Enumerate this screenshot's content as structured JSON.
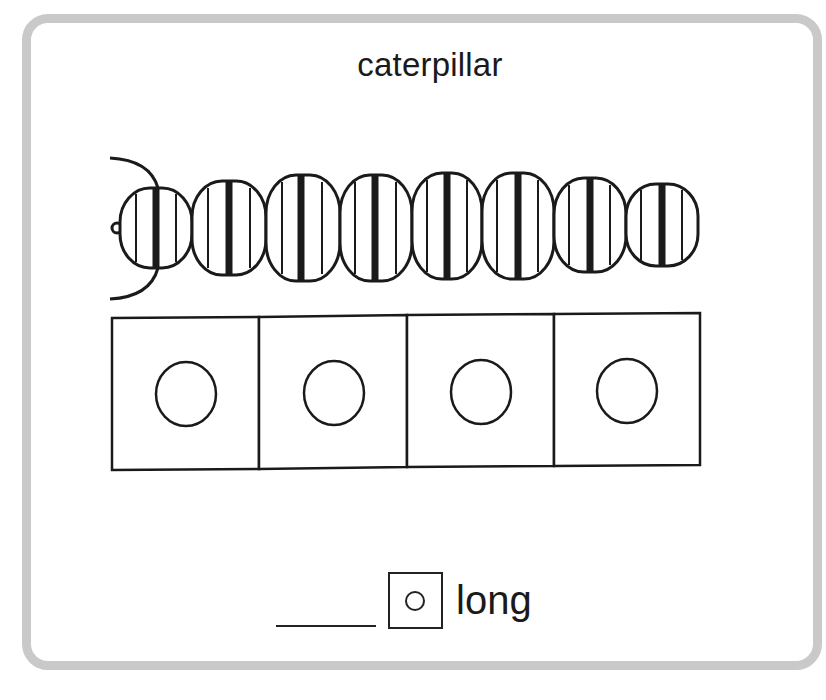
{
  "card": {
    "word": "caterpillar",
    "picture": "caterpillar-illustration",
    "caterpillar_segments": 8,
    "sound_boxes": {
      "count": 4,
      "marker": "circle"
    },
    "answer": {
      "blank": "",
      "vowel_symbol": "circle",
      "vowel_label": "long"
    }
  },
  "colors": {
    "frame": "#c9c9c9",
    "ink": "#1a1a1a",
    "background": "#ffffff"
  }
}
